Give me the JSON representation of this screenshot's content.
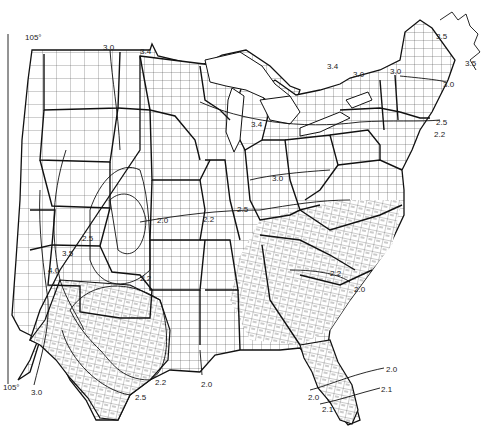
{
  "map": {
    "subject": "Contiguous eastern and central United States county outline map with isopleth contours",
    "meridian_labels": [
      {
        "text": "105°",
        "x": 25,
        "y": 34
      },
      {
        "text": "105°",
        "x": 3,
        "y": 384
      }
    ],
    "contour_labels": [
      {
        "text": "3.0",
        "x": 103,
        "y": 44
      },
      {
        "text": "3.4",
        "x": 140,
        "y": 48
      },
      {
        "text": "3.5",
        "x": 436,
        "y": 33
      },
      {
        "text": "3.5",
        "x": 465,
        "y": 60
      },
      {
        "text": "3.4",
        "x": 327,
        "y": 63
      },
      {
        "text": "3.0",
        "x": 353,
        "y": 71
      },
      {
        "text": "3.0",
        "x": 390,
        "y": 68
      },
      {
        "text": "3.0",
        "x": 443,
        "y": 81
      },
      {
        "text": "3.4",
        "x": 251,
        "y": 121
      },
      {
        "text": "2.5",
        "x": 436,
        "y": 119
      },
      {
        "text": "2.2",
        "x": 434,
        "y": 131
      },
      {
        "text": "3.0",
        "x": 272,
        "y": 175
      },
      {
        "text": "2.0",
        "x": 157,
        "y": 217
      },
      {
        "text": "2.2",
        "x": 203,
        "y": 216
      },
      {
        "text": "2.5",
        "x": 237,
        "y": 206
      },
      {
        "text": "2.5",
        "x": 82,
        "y": 235
      },
      {
        "text": "3.5",
        "x": 62,
        "y": 250
      },
      {
        "text": "4.0",
        "x": 48,
        "y": 267
      },
      {
        "text": "2.2",
        "x": 140,
        "y": 275
      },
      {
        "text": "2.2",
        "x": 330,
        "y": 270
      },
      {
        "text": "2.0",
        "x": 354,
        "y": 286
      },
      {
        "text": "2.2",
        "x": 155,
        "y": 379
      },
      {
        "text": "2.0",
        "x": 201,
        "y": 381
      },
      {
        "text": "3.0",
        "x": 31,
        "y": 389
      },
      {
        "text": "2.5",
        "x": 135,
        "y": 394
      },
      {
        "text": "2.0",
        "x": 386,
        "y": 366
      },
      {
        "text": "2.1",
        "x": 381,
        "y": 386
      },
      {
        "text": "2.0",
        "x": 308,
        "y": 394
      },
      {
        "text": "2.1",
        "x": 322,
        "y": 406
      }
    ]
  }
}
